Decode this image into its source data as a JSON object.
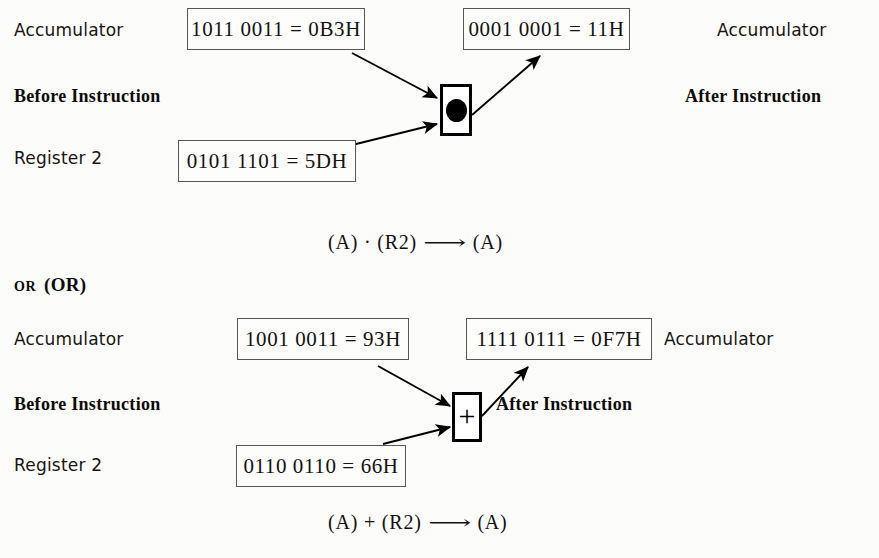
{
  "figure": {
    "background_color": "#fcfcfa",
    "ink_color": "#141210"
  },
  "sections": [
    {
      "id": "and-section",
      "operator_symbol": "dot",
      "operator_name": "and-dot-symbol",
      "left_labels": {
        "accumulator": "Accumulator",
        "phase": "Before Instruction",
        "register": "Register 2"
      },
      "right_labels": {
        "accumulator": "Accumulator",
        "phase": "After Instruction"
      },
      "boxes": {
        "accumulator_before": "1011 0011 = 0B3H",
        "register_before": "0101 1101 = 5DH",
        "accumulator_after": "0001 0001 = 11H"
      },
      "formula": {
        "left": "(A) · (R2)",
        "arrow": "⟶",
        "right": "(A)"
      }
    },
    {
      "id": "or-section",
      "heading_small": "OR",
      "heading_big": "(OR)",
      "operator_symbol": "plus",
      "operator_name": "or-plus-symbol",
      "left_labels": {
        "accumulator": "Accumulator",
        "phase": "Before Instruction",
        "register": "Register 2"
      },
      "right_labels": {
        "accumulator": "Accumulator",
        "phase": "After Instruction"
      },
      "boxes": {
        "accumulator_before": "1001 0011 = 93H",
        "register_before": "0110 0110 = 66H",
        "accumulator_after": "1111 0111 = 0F7H"
      },
      "formula": {
        "left": "(A) + (R2)",
        "arrow": "⟶",
        "right": "(A)"
      }
    }
  ]
}
